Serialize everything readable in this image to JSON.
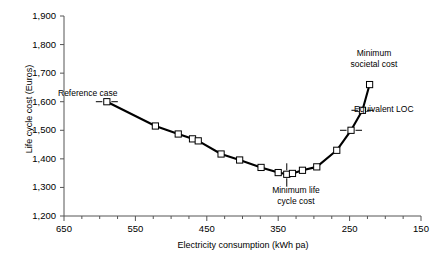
{
  "chart_data": {
    "type": "line",
    "title": "",
    "xlabel": "Electricity consumption (kWh pa)",
    "ylabel": "Life cycle cost (Euros)",
    "xlim": [
      650,
      150
    ],
    "ylim": [
      1200,
      1900
    ],
    "x_ticks": [
      650,
      550,
      450,
      350,
      250,
      150
    ],
    "x_tick_labels": [
      "650",
      "550",
      "450",
      "350",
      "250",
      "150"
    ],
    "x_minor_step": 25,
    "y_ticks": [
      1200,
      1300,
      1400,
      1500,
      1600,
      1700,
      1800,
      1900
    ],
    "y_tick_labels": [
      "1,200",
      "1,300",
      "1,400",
      "1,500",
      "1,600",
      "1,700",
      "1,800",
      "1,900"
    ],
    "grid": false,
    "legend": "none",
    "axis_direction_x": "reversed",
    "series": [
      {
        "name": "Life cycle cost curve",
        "marker": "open-square",
        "line_color": "#000000",
        "marker_fill": "#ffffff",
        "x": [
          590,
          522,
          490,
          470,
          462,
          430,
          404,
          374,
          350,
          338,
          330,
          316,
          296,
          268,
          248,
          232,
          222
        ],
        "y": [
          1600,
          1515,
          1487,
          1470,
          1463,
          1417,
          1396,
          1370,
          1352,
          1346,
          1349,
          1360,
          1372,
          1430,
          1500,
          1570,
          1660
        ]
      }
    ],
    "annotations": [
      {
        "id": "reference-case",
        "text": "Reference case",
        "x": 590,
        "y": 1600
      },
      {
        "id": "minimum-life-cycle-cost",
        "text": "Minimum life cycle cost",
        "line1": "Minimum life",
        "line2": "cycle cost",
        "x": 338,
        "y": 1346
      },
      {
        "id": "minimum-societal-cost",
        "text": "Minimum societal cost",
        "line1": "Minimum",
        "line2": "societal cost",
        "x": 232,
        "y": 1570
      },
      {
        "id": "equivalent-loc",
        "text": "Equivalent LOC",
        "x": 248,
        "y": 1500
      }
    ],
    "colors": {
      "line": "#000000",
      "axis": "#555555",
      "text": "#000000",
      "marker_fill": "#ffffff"
    }
  }
}
